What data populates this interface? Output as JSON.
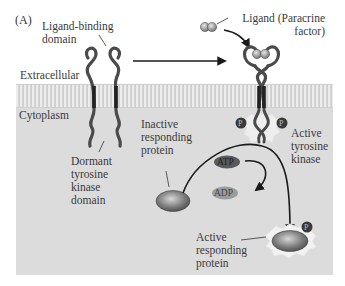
{
  "figure": {
    "panel_label": "(A)",
    "regions": {
      "extracellular": "Extracellular",
      "cytoplasm": "Cytoplasm"
    },
    "labels": {
      "ligand_binding_domain_line1": "Ligand-binding",
      "ligand_binding_domain_line2": "domain",
      "ligand_line1": "Ligand (Paracrine",
      "ligand_line2": "factor)",
      "dormant_line1": "Dormant",
      "dormant_line2": "tyrosine",
      "dormant_line3": "kinase",
      "dormant_line4": "domain",
      "inactive_line1": "Inactive",
      "inactive_line2": "responding",
      "inactive_line3": "protein",
      "active_kinase_line1": "Active",
      "active_kinase_line2": "tyrosine",
      "active_kinase_line3": "kinase",
      "active_protein_line1": "Active",
      "active_protein_line2": "responding",
      "active_protein_line3": "protein"
    },
    "molecules": {
      "atp": "ATP",
      "adp": "ADP",
      "phosphate": "P"
    },
    "colors": {
      "background_panel": "#dcdcdc",
      "membrane": "#c8c8c8",
      "receptor": "#4a4a4a",
      "atp_fill": "#5a5a5a",
      "adp_fill": "#9a9a9a",
      "protein_fill": "#7a7a7a",
      "arrow": "#1a1a1a"
    }
  }
}
